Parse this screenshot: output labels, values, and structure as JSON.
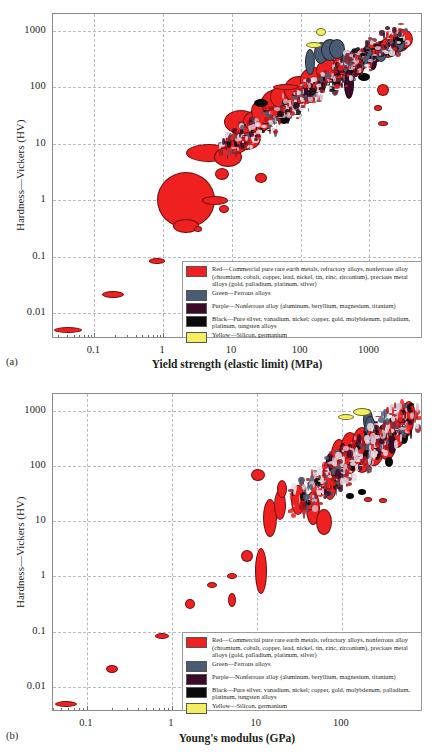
{
  "figure": {
    "panels": [
      {
        "id": "a",
        "label": "(a)",
        "xlabel": "Yield strength (elastic limit) (MPa)",
        "ylabel": "Hardness—Vickers (HV)"
      },
      {
        "id": "b",
        "label": "(b)",
        "xlabel": "Young's modulus (GPa)",
        "ylabel": "Hardness—Vickers (HV)"
      }
    ]
  },
  "legend": {
    "entries": [
      {
        "color": "#ef2020",
        "swatch_name": "red",
        "text": "Red—Commercial pure rare earth metals, refractory alloys, nonferrous alloy (chromium, cobalt, copper, lead, nickel, tin, zinc, zirconium), precious metal alloys (gold, palladium, platinum, silver)"
      },
      {
        "color": "#4a5c74",
        "swatch_name": "green-ferrous",
        "text": "Green—Ferrous alloys"
      },
      {
        "color": "#3b0a28",
        "swatch_name": "purple",
        "text": "Purple—Nonferrous alloy (aluminum, beryllium, magnesium, titanium)"
      },
      {
        "color": "#0a0a0a",
        "swatch_name": "black",
        "text": "Black—Pure silver, vanadium, nickel; copper, gold, molybdenum, palladium, platinum, tungsten alloys"
      },
      {
        "color": "#f2ee5e",
        "swatch_name": "yellow",
        "text": "Yellow—Silicon, germanium"
      }
    ]
  },
  "chart_data": [
    {
      "type": "scatter",
      "id": "a",
      "title": "",
      "xlabel": "Yield strength (elastic limit) (MPa)",
      "ylabel": "Hardness—Vickers (HV)",
      "xscale": "log",
      "yscale": "log",
      "xlim": [
        0.025,
        6000
      ],
      "ylim": [
        0.0035,
        2000
      ],
      "xticks": [
        0.1,
        1,
        10,
        100,
        1000
      ],
      "xticklabels": [
        "0.1",
        "1",
        "10",
        "100",
        "1000"
      ],
      "yticks": [
        0.01,
        0.1,
        1,
        10,
        100,
        1000
      ],
      "yticklabels": [
        "0.01",
        "0.1",
        "1",
        "10",
        "100",
        "1000"
      ],
      "grid": true,
      "legend_position": "lower-right",
      "series": [
        {
          "name": "Red—Commercial pure rare earth metals, refractory alloys, nonferrous alloy, precious metal alloys",
          "color": "#ef2020",
          "points": [
            {
              "x": 0.04,
              "y": 0.0052,
              "rx": 13,
              "ry": 2
            },
            {
              "x": 0.18,
              "y": 0.022,
              "rx": 10,
              "ry": 2.5
            },
            {
              "x": 0.78,
              "y": 0.088,
              "rx": 7,
              "ry": 1.8
            },
            {
              "x": 2.1,
              "y": 1.05,
              "rx": 28,
              "ry": 27
            },
            {
              "x": 2.1,
              "y": 0.37,
              "rx": 12,
              "ry": 6
            },
            {
              "x": 3.1,
              "y": 0.33,
              "rx": 3,
              "ry": 2
            },
            {
              "x": 5.4,
              "y": 1.05,
              "rx": 12,
              "ry": 3.5
            },
            {
              "x": 7.3,
              "y": 0.73,
              "rx": 4,
              "ry": 3
            },
            {
              "x": 4.5,
              "y": 7.3,
              "rx": 22,
              "ry": 8
            },
            {
              "x": 8.5,
              "y": 6.0,
              "rx": 13,
              "ry": 9
            },
            {
              "x": 7.0,
              "y": 3.0,
              "rx": 6,
              "ry": 5
            },
            {
              "x": 11,
              "y": 10.5,
              "rx": 11,
              "ry": 9
            },
            {
              "x": 16,
              "y": 13,
              "rx": 13,
              "ry": 11
            },
            {
              "x": 13,
              "y": 25,
              "rx": 16,
              "ry": 11
            },
            {
              "x": 23,
              "y": 26,
              "rx": 14,
              "ry": 10
            },
            {
              "x": 26,
              "y": 2.6,
              "rx": 5,
              "ry": 4
            },
            {
              "x": 30,
              "y": 40,
              "rx": 14,
              "ry": 12
            },
            {
              "x": 45,
              "y": 55,
              "rx": 16,
              "ry": 13
            },
            {
              "x": 60,
              "y": 70,
              "rx": 15,
              "ry": 12
            },
            {
              "x": 90,
              "y": 95,
              "rx": 14,
              "ry": 13
            },
            {
              "x": 150,
              "y": 140,
              "rx": 13,
              "ry": 12
            },
            {
              "x": 250,
              "y": 200,
              "rx": 12,
              "ry": 11
            },
            {
              "x": 420,
              "y": 260,
              "rx": 11,
              "ry": 10
            },
            {
              "x": 700,
              "y": 320,
              "rx": 10,
              "ry": 9
            },
            {
              "x": 1100,
              "y": 420,
              "rx": 10,
              "ry": 9
            },
            {
              "x": 1800,
              "y": 520,
              "rx": 9,
              "ry": 9
            },
            {
              "x": 2600,
              "y": 700,
              "rx": 10,
              "ry": 10
            },
            {
              "x": 3000,
              "y": 760,
              "rx": 9,
              "ry": 9
            },
            {
              "x": 1500,
              "y": 95,
              "rx": 5,
              "ry": 5
            },
            {
              "x": 1300,
              "y": 45,
              "rx": 3,
              "ry": 2
            },
            {
              "x": 1500,
              "y": 24,
              "rx": 4,
              "ry": 1.5
            },
            {
              "x": 60,
              "y": 105,
              "rx": 12,
              "ry": 2
            }
          ]
        },
        {
          "name": "Green—Ferrous alloys",
          "color": "#4a5c74",
          "points": [
            {
              "x": 130,
              "y": 300,
              "rx": 4,
              "ry": 12
            },
            {
              "x": 190,
              "y": 430,
              "rx": 6,
              "ry": 10
            },
            {
              "x": 260,
              "y": 480,
              "rx": 8,
              "ry": 10
            },
            {
              "x": 330,
              "y": 500,
              "rx": 7,
              "ry": 9
            },
            {
              "x": 450,
              "y": 300,
              "rx": 5,
              "ry": 11
            },
            {
              "x": 600,
              "y": 330,
              "rx": 5,
              "ry": 10
            },
            {
              "x": 900,
              "y": 380,
              "rx": 5,
              "ry": 9
            },
            {
              "x": 1400,
              "y": 430,
              "rx": 5,
              "ry": 8
            },
            {
              "x": 2000,
              "y": 520,
              "rx": 5,
              "ry": 8
            },
            {
              "x": 2600,
              "y": 620,
              "rx": 5,
              "ry": 7
            }
          ]
        },
        {
          "name": "Purple—Nonferrous alloy (aluminum, beryllium, magnesium, titanium)",
          "color": "#3b0a28",
          "points": [
            {
              "x": 120,
              "y": 85,
              "rx": 3,
              "ry": 7
            },
            {
              "x": 200,
              "y": 120,
              "rx": 3,
              "ry": 8
            },
            {
              "x": 330,
              "y": 150,
              "rx": 3,
              "ry": 8
            },
            {
              "x": 480,
              "y": 120,
              "rx": 4,
              "ry": 14
            },
            {
              "x": 700,
              "y": 240,
              "rx": 3,
              "ry": 8
            },
            {
              "x": 1100,
              "y": 300,
              "rx": 3,
              "ry": 7
            }
          ]
        },
        {
          "name": "Black—Pure silver, vanadium, nickel; copper, gold, molybdenum, palladium, platinum, tungsten alloys",
          "color": "#0a0a0a",
          "points": [
            {
              "x": 26,
              "y": 55,
              "rx": 6,
              "ry": 3
            },
            {
              "x": 55,
              "y": 29,
              "rx": 5,
              "ry": 4
            },
            {
              "x": 800,
              "y": 160,
              "rx": 5,
              "ry": 3
            },
            {
              "x": 2600,
              "y": 740,
              "rx": 5,
              "ry": 5
            }
          ]
        },
        {
          "name": "Yellow—Silicon, germanium",
          "color": "#f2ee5e",
          "points": [
            {
              "x": 190,
              "y": 980,
              "rx": 4,
              "ry": 3
            },
            {
              "x": 150,
              "y": 600,
              "rx": 7,
              "ry": 2
            }
          ]
        }
      ]
    },
    {
      "type": "scatter",
      "id": "b",
      "title": "",
      "xlabel": "Young's modulus (GPa)",
      "ylabel": "Hardness—Vickers (HV)",
      "xscale": "log",
      "yscale": "log",
      "xlim": [
        0.04,
        900
      ],
      "ylim": [
        0.0035,
        2000
      ],
      "xticks": [
        0.1,
        1,
        10,
        100
      ],
      "xticklabels": [
        "0.1",
        "1",
        "10",
        "100"
      ],
      "yticks": [
        0.01,
        0.1,
        1,
        10,
        100,
        1000
      ],
      "yticklabels": [
        "0.01",
        "0.1",
        "1",
        "10",
        "100",
        "1000"
      ],
      "grid": true,
      "legend_position": "lower-right",
      "series": [
        {
          "name": "Red—Commercial pure rare earth metals, refractory alloys, nonferrous alloy, precious metal alloys",
          "color": "#ef2020",
          "points": [
            {
              "x": 0.055,
              "y": 0.0052,
              "rx": 10,
              "ry": 2
            },
            {
              "x": 0.19,
              "y": 0.022,
              "rx": 5,
              "ry": 3
            },
            {
              "x": 0.75,
              "y": 0.088,
              "rx": 6,
              "ry": 2
            },
            {
              "x": 1.6,
              "y": 0.33,
              "rx": 4,
              "ry": 4
            },
            {
              "x": 2.9,
              "y": 0.72,
              "rx": 4,
              "ry": 2
            },
            {
              "x": 5.0,
              "y": 0.39,
              "rx": 3,
              "ry": 6
            },
            {
              "x": 5.0,
              "y": 1.05,
              "rx": 4,
              "ry": 2
            },
            {
              "x": 7.5,
              "y": 2.4,
              "rx": 5,
              "ry": 5
            },
            {
              "x": 11,
              "y": 1.3,
              "rx": 5,
              "ry": 22
            },
            {
              "x": 10,
              "y": 70,
              "rx": 6,
              "ry": 5
            },
            {
              "x": 14,
              "y": 12,
              "rx": 6,
              "ry": 18
            },
            {
              "x": 18,
              "y": 20,
              "rx": 5,
              "ry": 14
            },
            {
              "x": 19,
              "y": 40,
              "rx": 4,
              "ry": 8
            },
            {
              "x": 30,
              "y": 25,
              "rx": 6,
              "ry": 14
            },
            {
              "x": 45,
              "y": 18,
              "rx": 6,
              "ry": 16
            },
            {
              "x": 60,
              "y": 10,
              "rx": 7,
              "ry": 12
            },
            {
              "x": 70,
              "y": 60,
              "rx": 7,
              "ry": 20
            },
            {
              "x": 90,
              "y": 120,
              "rx": 8,
              "ry": 22
            },
            {
              "x": 120,
              "y": 180,
              "rx": 9,
              "ry": 20
            },
            {
              "x": 170,
              "y": 200,
              "rx": 10,
              "ry": 22
            },
            {
              "x": 230,
              "y": 250,
              "rx": 10,
              "ry": 20
            },
            {
              "x": 330,
              "y": 300,
              "rx": 9,
              "ry": 18
            },
            {
              "x": 430,
              "y": 450,
              "rx": 8,
              "ry": 16
            },
            {
              "x": 550,
              "y": 700,
              "rx": 7,
              "ry": 16
            },
            {
              "x": 600,
              "y": 1000,
              "rx": 5,
              "ry": 10
            },
            {
              "x": 330,
              "y": 330,
              "rx": 6,
              "ry": 8
            },
            {
              "x": 200,
              "y": 26,
              "rx": 3,
              "ry": 1.5
            },
            {
              "x": 300,
              "y": 25,
              "rx": 3,
              "ry": 1.5
            }
          ]
        },
        {
          "name": "Green—Ferrous alloys",
          "color": "#4a5c74",
          "points": [
            {
              "x": 200,
              "y": 700,
              "rx": 4,
              "ry": 10
            },
            {
              "x": 210,
              "y": 480,
              "rx": 5,
              "ry": 12
            },
            {
              "x": 215,
              "y": 300,
              "rx": 5,
              "ry": 12
            },
            {
              "x": 205,
              "y": 200,
              "rx": 4,
              "ry": 10
            }
          ]
        },
        {
          "name": "Purple—Nonferrous alloy (aluminum, beryllium, magnesium, titanium)",
          "color": "#3b0a28",
          "points": [
            {
              "x": 70,
              "y": 120,
              "rx": 3,
              "ry": 8
            },
            {
              "x": 100,
              "y": 180,
              "rx": 3,
              "ry": 9
            },
            {
              "x": 150,
              "y": 200,
              "rx": 3,
              "ry": 9
            },
            {
              "x": 250,
              "y": 230,
              "rx": 4,
              "ry": 12
            },
            {
              "x": 380,
              "y": 260,
              "rx": 3,
              "ry": 9
            }
          ]
        },
        {
          "name": "Black—Pure silver, vanadium, nickel; copper, gold, molybdenum, palladium, platinum, tungsten alloys",
          "color": "#0a0a0a",
          "points": [
            {
              "x": 120,
              "y": 30,
              "rx": 3,
              "ry": 2
            },
            {
              "x": 170,
              "y": 35,
              "rx": 3,
              "ry": 2
            },
            {
              "x": 350,
              "y": 120,
              "rx": 3,
              "ry": 4
            },
            {
              "x": 520,
              "y": 330,
              "rx": 3,
              "ry": 5
            }
          ]
        },
        {
          "name": "Yellow—Silicon, germanium",
          "color": "#f2ee5e",
          "points": [
            {
              "x": 170,
              "y": 980,
              "rx": 8,
              "ry": 3
            },
            {
              "x": 110,
              "y": 800,
              "rx": 7,
              "ry": 2
            }
          ]
        }
      ]
    }
  ]
}
